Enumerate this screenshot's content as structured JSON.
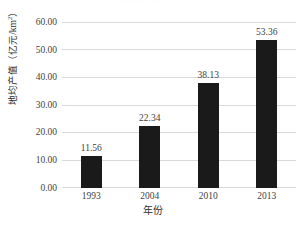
{
  "figure": {
    "background_color": "#ffffff",
    "title_remnant": "——— ——"
  },
  "chart_data": {
    "type": "bar",
    "title": "",
    "categories": [
      "1993",
      "2004",
      "2010",
      "2013"
    ],
    "values": [
      11.56,
      22.34,
      38.13,
      53.36
    ],
    "value_labels": [
      "11.56",
      "22.34",
      "38.13",
      "53.36"
    ],
    "xlabel": "年份",
    "ylabel": "地均产值（亿元/km²）",
    "ylabel_main": "地均产值（亿元/km",
    "ylabel_sup": "2",
    "ylabel_tail": "）",
    "ylim": [
      0,
      60
    ],
    "ytick_values": [
      0,
      10,
      20,
      30,
      40,
      50,
      60
    ],
    "ytick_labels": [
      "0.00",
      "10.00",
      "20.00",
      "30.00",
      "40.00",
      "50.00",
      "60.00"
    ],
    "grid": "horizontal",
    "legend": "none",
    "bar_color": "#1a1a1a",
    "gridline_color": "#d9d9d9"
  }
}
